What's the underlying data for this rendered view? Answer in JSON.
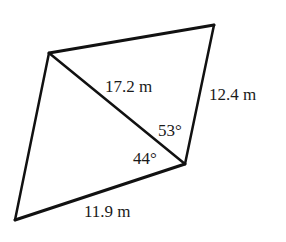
{
  "diagram": {
    "type": "quadrilateral-with-diagonal",
    "stroke_color": "#111111",
    "vertices": {
      "top_left": [
        49,
        53
      ],
      "top_right": [
        214,
        25
      ],
      "right": [
        185,
        164
      ],
      "bottom_left": [
        15,
        220
      ]
    },
    "labels": {
      "diagonal": "17.2 m",
      "right_side": "12.4 m",
      "bottom_side": "11.9 m",
      "upper_angle": "53°",
      "lower_angle": "44°"
    }
  }
}
